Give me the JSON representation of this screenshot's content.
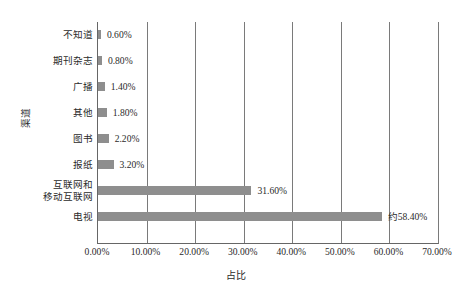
{
  "chart_data": {
    "type": "bar",
    "orientation": "horizontal",
    "title": "",
    "xlabel": "占比",
    "ylabel": "渠道",
    "categories": [
      "电视",
      "互联网和移动互联网",
      "报纸",
      "图书",
      "其他",
      "广播",
      "期刊杂志",
      "不知道"
    ],
    "values": [
      58.4,
      31.6,
      3.2,
      2.2,
      1.8,
      1.4,
      0.8,
      0.6
    ],
    "value_labels": [
      "约58.40%",
      "31.60%",
      "3.20%",
      "2.20%",
      "1.80%",
      "1.40%",
      "0.80%",
      "0.60%"
    ],
    "xlim": [
      0,
      70
    ],
    "xticks": [
      0,
      10,
      20,
      30,
      40,
      50,
      60,
      70
    ],
    "xtick_labels": [
      "0.00%",
      "10.00%",
      "20.00%",
      "30.00%",
      "40.00%",
      "50.00%",
      "60.00%",
      "70.00%"
    ],
    "grid": "vertical",
    "legend": "none",
    "bar_color": "#8e8e8e",
    "axis_color": "#666666"
  },
  "axes": {
    "y_title": "渠道",
    "x_title": "占比"
  },
  "rows": [
    {
      "label_line1": "不知道",
      "label_line2": "",
      "value_label": "0.60%",
      "value": 0.6
    },
    {
      "label_line1": "期刊杂志",
      "label_line2": "",
      "value_label": "0.80%",
      "value": 0.8
    },
    {
      "label_line1": "广播",
      "label_line2": "",
      "value_label": "1.40%",
      "value": 1.4
    },
    {
      "label_line1": "其他",
      "label_line2": "",
      "value_label": "1.80%",
      "value": 1.8
    },
    {
      "label_line1": "图书",
      "label_line2": "",
      "value_label": "2.20%",
      "value": 2.2
    },
    {
      "label_line1": "报纸",
      "label_line2": "",
      "value_label": "3.20%",
      "value": 3.2
    },
    {
      "label_line1": "互联网和",
      "label_line2": "移动互联网",
      "value_label": "31.60%",
      "value": 31.6
    },
    {
      "label_line1": "电视",
      "label_line2": "",
      "value_label": "约58.40%",
      "value": 58.4
    }
  ],
  "xticks": [
    {
      "label": "0.00%",
      "value": 0
    },
    {
      "label": "10.00%",
      "value": 10
    },
    {
      "label": "20.00%",
      "value": 20
    },
    {
      "label": "30.00%",
      "value": 30
    },
    {
      "label": "40.00%",
      "value": 40
    },
    {
      "label": "50.00%",
      "value": 50
    },
    {
      "label": "60.00%",
      "value": 60
    },
    {
      "label": "70.00%",
      "value": 70
    }
  ]
}
